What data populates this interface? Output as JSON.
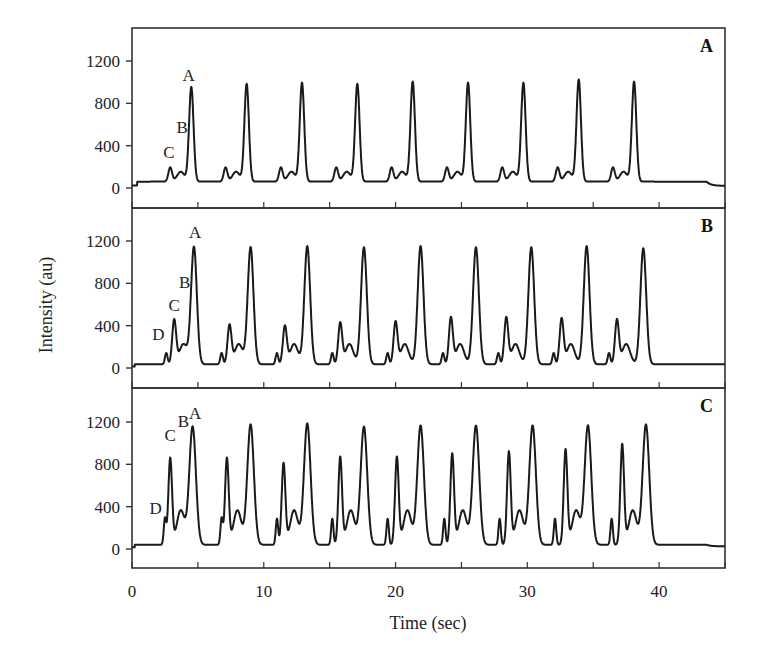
{
  "chart_data": {
    "type": "line",
    "title": "",
    "xlabel": "Time (sec)",
    "ylabel": "Intensity (au)",
    "xlim": [
      0,
      45
    ],
    "x_ticks": [
      0,
      10,
      20,
      30,
      40
    ],
    "x_minor_ticks": [
      5,
      15,
      25,
      35,
      45
    ],
    "ylim": [
      -170,
      1480
    ],
    "y_ticks": [
      0,
      400,
      800,
      1200
    ],
    "grid": false,
    "legend": null,
    "panels": [
      {
        "label": "A",
        "baseline": 60,
        "end_baseline": 20,
        "end_drop_time": 43.6,
        "start_time": 0.4,
        "peak_labels": [
          {
            "text": "A",
            "t": 4.3,
            "y": 1010
          },
          {
            "text": "B",
            "t": 3.8,
            "y": 520
          },
          {
            "text": "C",
            "t": 2.8,
            "y": 280
          }
        ],
        "peaks": [
          {
            "name": "C",
            "times": [
              2.9,
              7.1,
              11.3,
              15.5,
              19.7,
              23.9,
              28.1,
              32.3,
              36.5
            ],
            "height": 140,
            "width": 0.14
          },
          {
            "name": "B",
            "times": [
              3.7,
              7.9,
              12.1,
              16.3,
              20.5,
              24.7,
              28.9,
              33.1,
              37.3
            ],
            "height": 100,
            "width": 0.28
          },
          {
            "name": "A",
            "times": [
              4.5,
              8.7,
              12.9,
              17.1,
              21.3,
              25.5,
              29.7,
              33.9,
              38.1
            ],
            "heights": [
              900,
              930,
              940,
              930,
              950,
              940,
              940,
              970,
              950
            ],
            "width": 0.17
          }
        ]
      },
      {
        "label": "B",
        "baseline": 35,
        "end_baseline": 35,
        "end_drop_time": 45,
        "start_time": 0.2,
        "peak_labels": [
          {
            "text": "A",
            "t": 4.8,
            "y": 1230
          },
          {
            "text": "B",
            "t": 4.0,
            "y": 760
          },
          {
            "text": "C",
            "t": 3.2,
            "y": 540
          },
          {
            "text": "D",
            "t": 2.0,
            "y": 260
          }
        ],
        "peaks": [
          {
            "name": "D",
            "times": [
              2.6,
              6.8,
              11.0,
              15.2,
              19.4,
              23.6,
              27.8,
              32.0,
              36.2
            ],
            "height": 110,
            "width": 0.1
          },
          {
            "name": "C",
            "times": [
              3.2,
              7.4,
              11.6,
              15.8,
              20.0,
              24.2,
              28.4,
              32.6,
              36.8
            ],
            "heights": [
              420,
              370,
              360,
              390,
              400,
              440,
              440,
              430,
              420
            ],
            "width": 0.15
          },
          {
            "name": "B",
            "times": [
              3.9,
              8.1,
              12.3,
              16.5,
              20.7,
              24.9,
              29.1,
              33.3,
              37.5
            ],
            "height": 195,
            "width": 0.3
          },
          {
            "name": "A",
            "times": [
              4.7,
              9.0,
              13.3,
              17.6,
              21.9,
              26.1,
              30.3,
              34.5,
              38.8
            ],
            "heights": [
              1110,
              1110,
              1120,
              1110,
              1120,
              1110,
              1110,
              1120,
              1100
            ],
            "width": 0.22
          }
        ]
      },
      {
        "label": "C",
        "baseline": 40,
        "end_baseline": 25,
        "end_drop_time": 43.6,
        "start_time": 0.2,
        "peak_labels": [
          {
            "text": "A",
            "t": 4.8,
            "y": 1230
          },
          {
            "text": "B",
            "t": 3.9,
            "y": 1150
          },
          {
            "text": "C",
            "t": 2.9,
            "y": 1020
          },
          {
            "text": "D",
            "t": 1.8,
            "y": 330
          }
        ],
        "peaks": [
          {
            "name": "D",
            "times": [
              2.5,
              6.8,
              11.0,
              15.2,
              19.4,
              23.7,
              27.9,
              32.1,
              36.4
            ],
            "height": 250,
            "width": 0.09
          },
          {
            "name": "C",
            "times": [
              2.9,
              7.2,
              11.5,
              15.8,
              20.1,
              24.3,
              28.6,
              32.9,
              37.2
            ],
            "heights": [
              820,
              820,
              770,
              830,
              830,
              860,
              880,
              900,
              950
            ],
            "width": 0.14
          },
          {
            "name": "B",
            "times": [
              3.7,
              8.0,
              12.3,
              16.6,
              20.9,
              25.1,
              29.4,
              33.7,
              38.0
            ],
            "height": 330,
            "width": 0.3
          },
          {
            "name": "A",
            "times": [
              4.6,
              9.0,
              13.3,
              17.6,
              21.9,
              26.1,
              30.4,
              34.6,
              39.0
            ],
            "heights": [
              1120,
              1140,
              1150,
              1120,
              1130,
              1130,
              1130,
              1130,
              1140
            ],
            "width": 0.25
          }
        ]
      }
    ]
  },
  "axes": {
    "xlabel": "Time (sec)",
    "ylabel": "Intensity (au)",
    "x_tick_labels": [
      "0",
      "10",
      "20",
      "30",
      "40"
    ],
    "y_tick_labels": [
      "0",
      "400",
      "800",
      "1200"
    ]
  },
  "colors": {
    "line": "#1a1a1a",
    "axis": "#333333",
    "background": "#ffffff"
  }
}
